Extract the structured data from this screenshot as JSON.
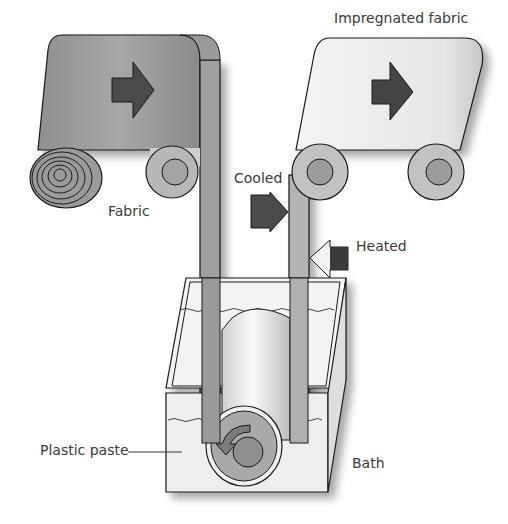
{
  "labels": {
    "impregnated_fabric": "Impregnated fabric",
    "fabric": "Fabric",
    "cooled": "Cooled",
    "heated": "Heated",
    "plastic_paste": "Plastic paste",
    "bath": "Bath"
  },
  "colors": {
    "fabric_gray": "#9a9a9a",
    "impregnated_light": "#e8e8e8",
    "arrow_dark": "#4a4a4a",
    "outline": "#1a1a1a",
    "roller_face": "#b5b5b5",
    "roller_hub": "#8c8c8c",
    "bath_fill": "#eeeeee"
  }
}
